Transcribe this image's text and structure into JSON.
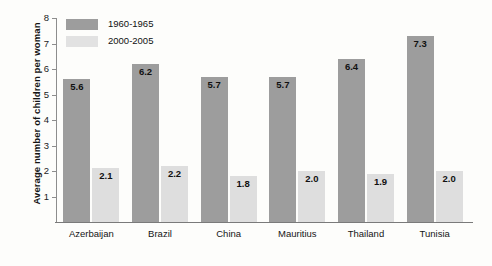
{
  "chart_data": {
    "type": "bar",
    "title": "",
    "xlabel": "",
    "ylabel": "Average number of children per woman",
    "ylim": [
      0,
      8
    ],
    "ytick_labels": [
      "8",
      "7",
      "6",
      "5",
      "4",
      "3",
      "2",
      "1"
    ],
    "yticks": [
      8,
      7,
      6,
      5,
      4,
      3,
      2,
      1
    ],
    "grid": false,
    "legend_position": "top-left",
    "categories": [
      "Azerbaijan",
      "Brazil",
      "China",
      "Mauritius",
      "Thailand",
      "Tunisia"
    ],
    "series": [
      {
        "name": "1960-1965",
        "color": "#9d9d9d",
        "values": [
          5.6,
          6.2,
          5.7,
          5.7,
          6.4,
          7.3
        ],
        "labels": [
          "5.6",
          "6.2",
          "5.7",
          "5.7",
          "6.4",
          "7.3"
        ]
      },
      {
        "name": "2000-2005",
        "color": "#dedede",
        "values": [
          2.1,
          2.2,
          1.8,
          2.0,
          1.9,
          2.0
        ],
        "labels": [
          "2.1",
          "2.2",
          "1.8",
          "2.0",
          "1.9",
          "2.0"
        ]
      }
    ]
  }
}
